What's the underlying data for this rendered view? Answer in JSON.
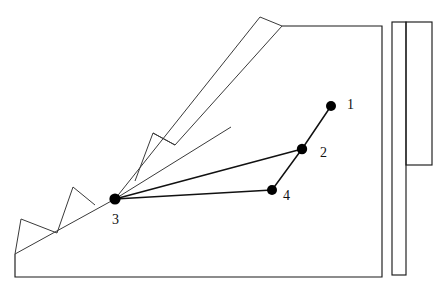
{
  "figure": {
    "background_color": "#ffffff",
    "line_color": "#1a1a1a",
    "joint_color": "#000000",
    "width": 438,
    "height": 292
  },
  "joints": [
    {
      "id": "1",
      "label": "1",
      "cx": 331,
      "cy": 106,
      "r": 5.0,
      "label_x": 347,
      "label_y": 106
    },
    {
      "id": "2",
      "label": "2",
      "cx": 302,
      "cy": 149,
      "r": 5.2,
      "label_x": 320,
      "label_y": 154
    },
    {
      "id": "3",
      "label": "3",
      "cx": 115,
      "cy": 199,
      "r": 5.6,
      "label_x": 112,
      "label_y": 221
    },
    {
      "id": "4",
      "label": "4",
      "cx": 272,
      "cy": 190,
      "r": 5.0,
      "label_x": 283,
      "label_y": 197
    }
  ],
  "linkage_bars": [
    {
      "name": "bar-1-2",
      "from": "1",
      "to": "2",
      "x1": 331,
      "y1": 106,
      "x2": 302,
      "y2": 149
    },
    {
      "name": "bar-2-3",
      "from": "2",
      "to": "3",
      "x1": 302,
      "y1": 149,
      "x2": 115,
      "y2": 199
    },
    {
      "name": "bar-2-4",
      "from": "2",
      "to": "4",
      "x1": 302,
      "y1": 149,
      "x2": 272,
      "y2": 190
    },
    {
      "name": "bar-3-4",
      "from": "3",
      "to": "4",
      "x1": 115,
      "y1": 199,
      "x2": 272,
      "y2": 190
    }
  ],
  "shapes": {
    "ground_frame": "M 15,254 L 15,277 L 382,277 L 382,26 L 282,26",
    "slope_edge": "M 15,254 L 115,199",
    "slope_upper": "M 115,199 L 153,133",
    "bucket_blade_left": "M 115,199 L 260,17",
    "bucket_blade_right": "M 153,133 L 175,145 L 282,26",
    "blade_tip": "M 260,17 L 282,26",
    "blade_inner_edge": "M 175,145 L 231,127",
    "tooth_1": "M 15,254 L 21,219 L 57,233",
    "tooth_2": "M 57,233 L 73,187 L 95,205",
    "tooth_3": "M 135,181 L 153,133 L 175,145",
    "tooth_1_base": "M 21,219 L 57,233",
    "blade_lower_edge": "M 115,199 L 231,127"
  },
  "right_column": {
    "tall_bar": {
      "x": 392,
      "y": 22,
      "width": 14,
      "height": 253,
      "name": "tall-vertical-bar"
    },
    "wide_bar": {
      "x": 406,
      "y": 22,
      "width": 26,
      "height": 143,
      "name": "wide-vertical-bar"
    }
  }
}
